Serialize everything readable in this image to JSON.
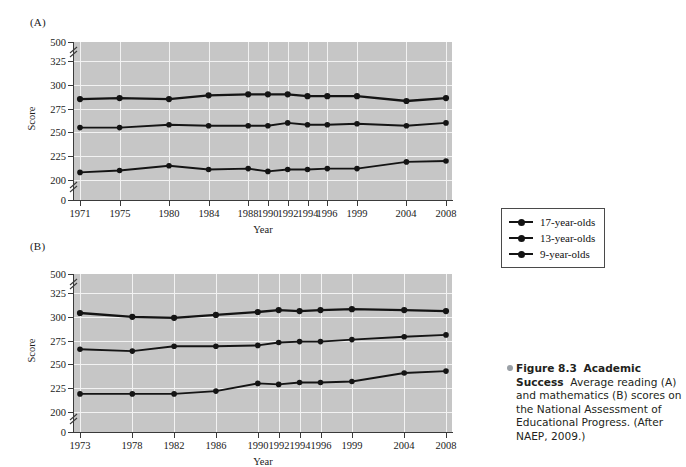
{
  "figure": {
    "panel_a_letter": "(A)",
    "panel_b_letter": "(B)",
    "axis_titles": {
      "y": "Score",
      "x": "Year"
    }
  },
  "legend": {
    "items": [
      {
        "label": "17-year-olds",
        "key": "17",
        "color": "#141414"
      },
      {
        "label": "13-year-olds",
        "key": "13",
        "color": "#141414"
      },
      {
        "label": "9-year-olds",
        "key": "9",
        "color": "#141414"
      }
    ]
  },
  "caption": {
    "fig_number": "Figure 8.3",
    "title": "Academic Success",
    "body": "Average reading (A) and mathematics (B) scores on the National Assessment of Educational Progress. (After NAEP, 2009.)"
  },
  "chart_data": [
    {
      "id": "panel-a",
      "type": "line",
      "title": "(A)",
      "subtitle": "Average reading scores",
      "xlabel": "Year",
      "ylabel": "Score",
      "categories": [
        "1971",
        "1975",
        "1980",
        "1984",
        "1988",
        "1990",
        "1992",
        "1994",
        "1996",
        "1999",
        "2004",
        "2008"
      ],
      "yticks": [
        0,
        200,
        225,
        250,
        275,
        300,
        325,
        500
      ],
      "ylim": [
        200,
        325
      ],
      "axis_breaks": [
        {
          "between": [
            0,
            200
          ]
        },
        {
          "between": [
            325,
            500
          ]
        }
      ],
      "grid": true,
      "legend_position": "right-outside",
      "series": [
        {
          "name": "17-year-olds",
          "values": [
            285,
            286,
            285,
            289,
            290,
            290,
            290,
            288,
            288,
            288,
            283,
            286
          ]
        },
        {
          "name": "13-year-olds",
          "values": [
            255,
            255,
            258,
            257,
            257,
            257,
            260,
            258,
            258,
            259,
            257,
            260
          ]
        },
        {
          "name": "9-year-olds",
          "values": [
            208,
            210,
            215,
            211,
            212,
            209,
            211,
            211,
            212,
            212,
            219,
            220
          ]
        }
      ]
    },
    {
      "id": "panel-b",
      "type": "line",
      "title": "(B)",
      "subtitle": "Average mathematics scores",
      "xlabel": "Year",
      "ylabel": "Score",
      "categories": [
        "1973",
        "1978",
        "1982",
        "1986",
        "1990",
        "1992",
        "1994",
        "1996",
        "1999",
        "2004",
        "2008"
      ],
      "yticks": [
        0,
        200,
        225,
        250,
        275,
        300,
        325,
        500
      ],
      "ylim": [
        200,
        325
      ],
      "axis_breaks": [
        {
          "between": [
            0,
            200
          ]
        },
        {
          "between": [
            325,
            500
          ]
        }
      ],
      "grid": true,
      "legend_position": "right-outside",
      "series": [
        {
          "name": "17-year-olds",
          "values": [
            304,
            300,
            299,
            302,
            305,
            307,
            306,
            307,
            308,
            307,
            306
          ]
        },
        {
          "name": "13-year-olds",
          "values": [
            266,
            264,
            269,
            269,
            270,
            273,
            274,
            274,
            276,
            279,
            281
          ]
        },
        {
          "name": "9-year-olds",
          "values": [
            219,
            219,
            219,
            222,
            230,
            229,
            231,
            231,
            232,
            241,
            243
          ]
        }
      ]
    }
  ],
  "style": {
    "plot_background": "#c6c6c6",
    "gridline_color": "#f2f2f2",
    "series_color": "#141414",
    "axis_color": "#3a3a3a",
    "page_background": "#ffffff"
  }
}
